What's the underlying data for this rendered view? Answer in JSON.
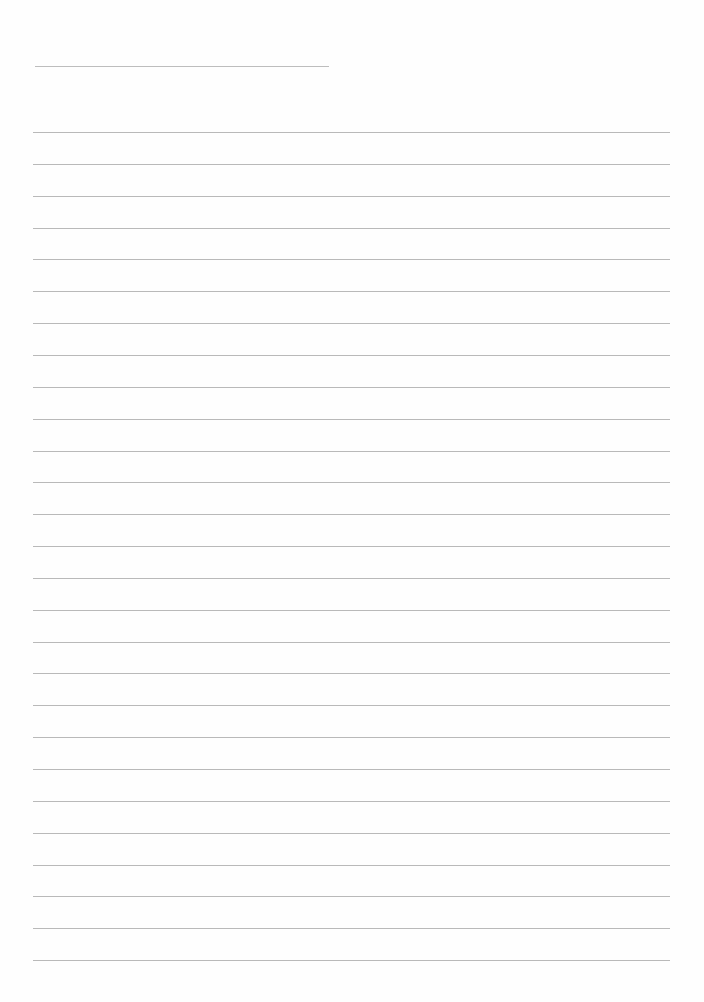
{
  "page": {
    "type": "lined-paper",
    "background_color": "#fefefe",
    "line_color": "#b9b9b9",
    "text": ""
  },
  "header_line": {
    "x_start": 35,
    "x_end": 329,
    "y": 66
  },
  "ruled_lines": {
    "count": 27,
    "x_start": 33,
    "x_end": 670,
    "first_y": 132,
    "last_y": 960,
    "spacing": 31.85
  }
}
